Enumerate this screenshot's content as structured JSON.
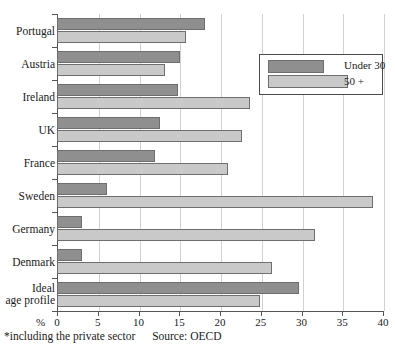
{
  "chart_data": {
    "type": "bar",
    "orientation": "horizontal",
    "title": "",
    "xlabel": "%",
    "ylabel": "",
    "xlim": [
      0,
      40
    ],
    "xticks": [
      0,
      5,
      10,
      15,
      20,
      25,
      30,
      35,
      40
    ],
    "grid": true,
    "legend_position": "top-right",
    "categories": [
      "Portugal",
      "Austria",
      "Ireland",
      "UK",
      "France",
      "Sweden",
      "Germany",
      "Denmark",
      "Ideal age profile"
    ],
    "series": [
      {
        "name": "Under 30",
        "color": "#8f8f8f",
        "values": [
          18.2,
          15.1,
          14.9,
          12.6,
          12.0,
          6.1,
          3.1,
          3.1,
          29.7
        ]
      },
      {
        "name": "50 +",
        "color": "#c9c9c9",
        "values": [
          15.8,
          13.3,
          23.7,
          22.7,
          21.0,
          38.8,
          31.6,
          26.4,
          24.9
        ]
      }
    ]
  },
  "axis": {
    "percent_symbol": "%",
    "tick_labels": [
      "0",
      "5",
      "10",
      "15",
      "20",
      "25",
      "30",
      "35",
      "40"
    ]
  },
  "legend": {
    "entries": [
      {
        "label": "Under 30",
        "color": "#8f8f8f"
      },
      {
        "label": "50 +",
        "color": "#c9c9c9"
      }
    ]
  },
  "category_labels": [
    {
      "line1": "Portugal",
      "line2": ""
    },
    {
      "line1": "Austria",
      "line2": ""
    },
    {
      "line1": "Ireland",
      "line2": ""
    },
    {
      "line1": "UK",
      "line2": ""
    },
    {
      "line1": "France",
      "line2": ""
    },
    {
      "line1": "Sweden",
      "line2": ""
    },
    {
      "line1": "Germany",
      "line2": ""
    },
    {
      "line1": "Denmark",
      "line2": ""
    },
    {
      "line1": "Ideal",
      "line2": "age profile"
    }
  ],
  "footnote": {
    "note": "*including the private sector",
    "source": "Source: OECD"
  }
}
